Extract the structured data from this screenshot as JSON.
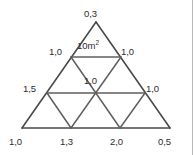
{
  "figure": {
    "background_color": "#ffffff",
    "line_color": "#4a4a4a",
    "text_color": "#2c2c2c",
    "border_color": "#b8b8b8",
    "decimal_separator": "comma",
    "unit": "m",
    "area_annotation": {
      "value": "10",
      "unit": "m",
      "exponent": "2",
      "full_text": "10m²",
      "location": "apex-triangle"
    },
    "labels": {
      "apex": "0,3",
      "row1_left": "1,0",
      "row1_right": "1,0",
      "center": "1,0",
      "row2_left": "1,5",
      "row2_right": "1,0",
      "bottom_1": "1,0",
      "bottom_2": "1,3",
      "bottom_3": "2,0",
      "bottom_4": "0,5"
    },
    "geometry": {
      "type": "triangular-grid",
      "rows": 3,
      "small_triangles": 9,
      "apex_point": [
        96,
        22
      ],
      "base_left_point": [
        22,
        128
      ],
      "base_right_point": [
        170,
        128
      ]
    }
  }
}
